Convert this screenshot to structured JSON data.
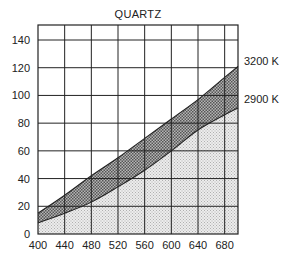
{
  "chart_data": {
    "type": "area",
    "title": "QUARTZ",
    "xlabel": "",
    "ylabel": "",
    "xlim": [
      400,
      700
    ],
    "ylim": [
      0,
      150
    ],
    "xticks": [
      400,
      440,
      480,
      520,
      560,
      600,
      640,
      680
    ],
    "yticks": [
      0,
      20,
      40,
      60,
      80,
      100,
      120,
      140
    ],
    "grid": true,
    "x": [
      400,
      440,
      480,
      520,
      560,
      600,
      640,
      680,
      700
    ],
    "series": [
      {
        "name": "3200 K",
        "values": [
          15,
          28,
          42,
          55,
          69,
          83,
          97,
          113,
          121
        ],
        "fill": "#8a8a8a"
      },
      {
        "name": "2900 K",
        "values": [
          8,
          15,
          23,
          34,
          46,
          60,
          75,
          86,
          91
        ],
        "fill": "#dcdcdc"
      }
    ]
  }
}
